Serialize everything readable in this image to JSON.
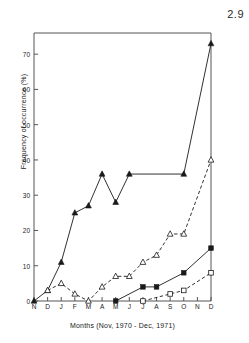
{
  "corner_label": "2.9",
  "chart_data": {
    "type": "line",
    "title": "",
    "xlabel": "Months (Nov, 1970 - Dec, 1971)",
    "ylabel": "Frequency of occurrence (%)",
    "categories": [
      "N",
      "D",
      "J",
      "F",
      "M",
      "A",
      "M",
      "J",
      "J",
      "A",
      "S",
      "O",
      "N",
      "D"
    ],
    "xtick_labels": [
      "N",
      "D",
      "J",
      "F",
      "M",
      "A",
      "M",
      "J",
      "J",
      "A",
      "S",
      "O",
      "N",
      "D"
    ],
    "ytick_labels": [
      "0",
      "10",
      "20",
      "30",
      "40",
      "50",
      "60",
      "70"
    ],
    "ytick_values": [
      0,
      10,
      20,
      30,
      40,
      50,
      60,
      70
    ],
    "ylim": [
      0,
      76
    ],
    "xlim": [
      0,
      13
    ],
    "grid": false,
    "legend": "none",
    "series": [
      {
        "name": "series-filled-triangle",
        "marker": "filled-triangle",
        "linestyle": "solid",
        "color": "#1a1a1a",
        "x": [
          0,
          1,
          2,
          3,
          4,
          5,
          6,
          7,
          11,
          13
        ],
        "values": [
          0,
          3,
          11,
          25,
          27,
          36,
          28,
          36,
          36,
          73
        ]
      },
      {
        "name": "series-open-triangle",
        "marker": "open-triangle",
        "linestyle": "dashed",
        "color": "#1a1a1a",
        "x": [
          1,
          2,
          3,
          4,
          5,
          6,
          7,
          8,
          9,
          10,
          11,
          13
        ],
        "values": [
          3,
          5,
          2,
          0,
          4,
          7,
          7,
          11,
          13,
          19,
          19,
          40
        ]
      },
      {
        "name": "series-filled-square",
        "marker": "filled-square",
        "linestyle": "solid",
        "color": "#1a1a1a",
        "x": [
          6,
          8,
          9,
          11,
          13
        ],
        "values": [
          0,
          4,
          4,
          8,
          15
        ]
      },
      {
        "name": "series-open-square",
        "marker": "open-square",
        "linestyle": "dashed",
        "color": "#1a1a1a",
        "x": [
          8,
          10,
          11,
          13
        ],
        "values": [
          0,
          2,
          3,
          8
        ]
      }
    ]
  },
  "axes": {
    "frame_color": "#555555"
  }
}
